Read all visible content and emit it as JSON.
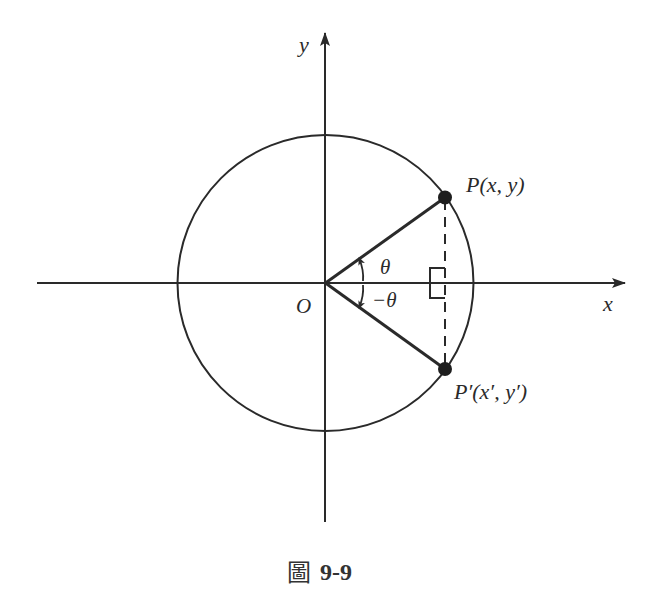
{
  "figure": {
    "caption_prefix": "圖",
    "caption_number": "9-9",
    "axes": {
      "x_label": "x",
      "y_label": "y",
      "origin_label": "O"
    },
    "points": {
      "P": {
        "label": "P(x,  y)"
      },
      "P_prime": {
        "label": "P′(x′,  y′)"
      }
    },
    "angles": {
      "theta": "θ",
      "neg_theta": "−θ"
    },
    "colors": {
      "stroke": "#2a2a2a",
      "background": "#ffffff"
    }
  }
}
